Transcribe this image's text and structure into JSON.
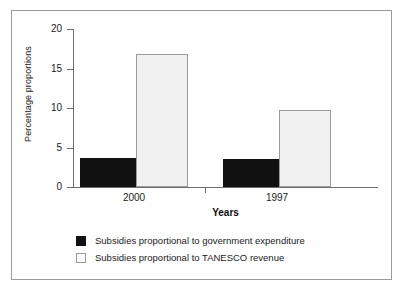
{
  "chart_data": {
    "type": "bar",
    "title": "",
    "xlabel": "Years",
    "ylabel": "Percentage proportions",
    "categories": [
      "2000",
      "1997"
    ],
    "series": [
      {
        "name": "Subsidies proportional to government expenditure",
        "color": "#111111",
        "values": [
          3.7,
          3.6
        ]
      },
      {
        "name": "Subsidies proportional to TANESCO revenue",
        "color": "#f1f1f1",
        "values": [
          16.8,
          9.8
        ]
      }
    ],
    "ylim": [
      0,
      20
    ],
    "yticks": [
      0,
      5,
      10,
      15,
      20
    ],
    "ytick_labels": [
      "0",
      "5",
      "10",
      "15",
      "20"
    ],
    "grid": false,
    "legend_position": "bottom-left"
  },
  "axes": {
    "y_label": "Percentage proportions",
    "x_label": "Years",
    "y_ticks": [
      {
        "value": 20,
        "label": "20"
      },
      {
        "value": 15,
        "label": "15"
      },
      {
        "value": 10,
        "label": "10"
      },
      {
        "value": 5,
        "label": "5"
      },
      {
        "value": 0,
        "label": "0"
      }
    ],
    "x_groups": [
      {
        "label": "2000"
      },
      {
        "label": "1997"
      }
    ]
  },
  "legend": {
    "items": [
      {
        "swatch": "dark",
        "label": "Subsidies proportional to government expenditure"
      },
      {
        "swatch": "light",
        "label": "Subsidies proportional to TANESCO revenue"
      }
    ]
  },
  "caption": {
    "remnant": ""
  }
}
